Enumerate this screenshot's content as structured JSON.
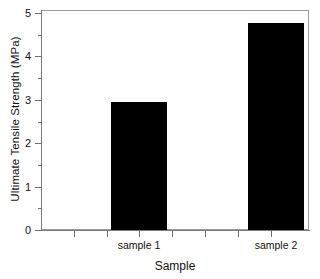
{
  "chart_data": {
    "type": "bar",
    "title": "",
    "xlabel": "Sample",
    "ylabel": "Ultimate Tensile Strength (MPa)",
    "categories": [
      "sample 1",
      "sample 2"
    ],
    "values": [
      2.95,
      4.77
    ],
    "ylim": [
      0,
      5.2
    ],
    "yticks": [
      0,
      1,
      2,
      3,
      4,
      5
    ],
    "ytick_labels": [
      "0",
      "1",
      "2",
      "3",
      "4",
      "5"
    ],
    "yminor_ticks": [
      0.5,
      1.5,
      2.5,
      3.5,
      4.5
    ],
    "xtick_labels": [
      "sample 1",
      "sample 2"
    ],
    "grid": false,
    "legend": false,
    "bar_color": "#000000",
    "plot_background": "#ffffff",
    "frame_color": "#9a9a9a",
    "axis_color": "#7b7b7b"
  },
  "axes": {
    "y_title": "Ultimate Tensile Strength (MPa)",
    "x_title": "Sample",
    "y_labels": {
      "v0": "0",
      "v1": "1",
      "v2": "2",
      "v3": "3",
      "v4": "4",
      "v5": "5"
    },
    "x_labels": {
      "c0": "sample 1",
      "c1": "sample 2"
    }
  }
}
